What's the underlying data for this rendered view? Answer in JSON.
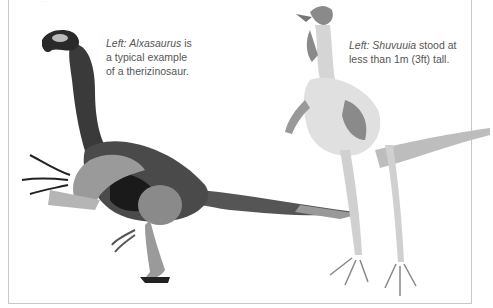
{
  "page": {
    "top_cut_text": "..."
  },
  "captions": [
    {
      "prefix": "Left:",
      "name": "Alxasaurus",
      "rest": "is a typical example of a therizinosaur."
    },
    {
      "prefix": "Left:",
      "name": "Shuvuuia",
      "rest": "stood at less than 1m (3ft) tall."
    }
  ],
  "illustrations": [
    {
      "subject": "Alxasaurus",
      "style": "greyscale feathered therizinosaur drawing"
    },
    {
      "subject": "Shuvuuia",
      "style": "light greyscale feathered alvarezsaur drawing"
    }
  ],
  "colors": {
    "border": "#c8c8c8",
    "caption_text": "#555555",
    "dark_feather": "#2a2a2a",
    "mid_feather": "#777777",
    "light_feather": "#cfcfcf"
  }
}
